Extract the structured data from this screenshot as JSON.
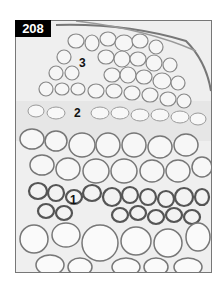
{
  "figure": {
    "number": "208",
    "labels": [
      {
        "id": "1",
        "text": "1",
        "x": 70,
        "y": 193
      },
      {
        "id": "2",
        "text": "2",
        "x": 74,
        "y": 106
      },
      {
        "id": "3",
        "text": "3",
        "x": 79,
        "y": 56
      }
    ],
    "colors": {
      "badge_bg": "#000000",
      "badge_text": "#ffffff",
      "cell_wall": "#6e6e6e",
      "cell_fill": "#ececec",
      "frame_border": "#777777"
    }
  }
}
